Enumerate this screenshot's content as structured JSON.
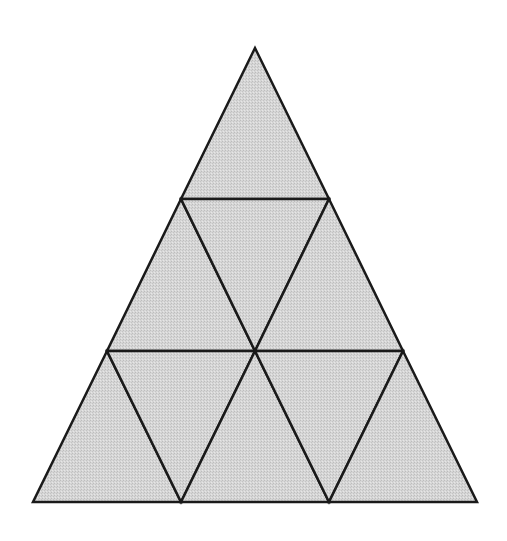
{
  "diagram": {
    "type": "subdivided-triangle",
    "rows": 3,
    "small_triangle_count": 9,
    "fill_color": "#d3d3d3",
    "stroke_color": "#1a1a1a",
    "stroke_width": 2.5,
    "vertices": {
      "apex": [
        255,
        48
      ],
      "bottom_left": [
        33,
        502
      ],
      "bottom_right": [
        477,
        502
      ]
    },
    "triangles": [
      {
        "id": "r1-t1",
        "points": "255,48 181,199 329,199"
      },
      {
        "id": "r2-t1",
        "points": "181,199 107,351 255,351"
      },
      {
        "id": "r2-t2",
        "points": "181,199 329,199 255,351"
      },
      {
        "id": "r2-t3",
        "points": "329,199 255,351 403,351"
      },
      {
        "id": "r3-t1",
        "points": "107,351 33,502 181,502"
      },
      {
        "id": "r3-t2",
        "points": "107,351 255,351 181,502"
      },
      {
        "id": "r3-t3",
        "points": "255,351 181,502 329,502"
      },
      {
        "id": "r3-t4",
        "points": "255,351 403,351 329,502"
      },
      {
        "id": "r3-t5",
        "points": "403,351 329,502 477,502"
      }
    ]
  }
}
